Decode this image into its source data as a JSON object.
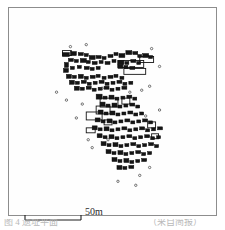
{
  "figure": {
    "kind": "archaeological-site-plan",
    "frame_color": "#8d8d8d",
    "background_color": "#ffffff",
    "ink_color": "#111111"
  },
  "scale": {
    "label": "50m",
    "bar_length_px": 56,
    "units": "m",
    "value": 50
  },
  "caption": {
    "left_fragment": "图 4  遗址平面",
    "right_fragment": "（采自简报）"
  },
  "map_data": {
    "type": "site-plan",
    "description": "Scatter of rectangular structure footprints forming a settlement band running from upper-left to lower-right across the plate.",
    "structures_filled": [
      [
        62,
        52,
        7,
        4
      ],
      [
        70,
        51,
        6,
        4
      ],
      [
        78,
        52,
        5,
        3
      ],
      [
        84,
        53,
        4,
        3
      ],
      [
        89,
        55,
        6,
        4
      ],
      [
        96,
        55,
        5,
        3
      ],
      [
        102,
        56,
        4,
        3
      ],
      [
        108,
        54,
        5,
        3
      ],
      [
        114,
        52,
        4,
        3
      ],
      [
        119,
        53,
        6,
        4
      ],
      [
        126,
        50,
        6,
        4
      ],
      [
        133,
        51,
        5,
        3
      ],
      [
        138,
        54,
        4,
        3
      ],
      [
        143,
        53,
        6,
        4
      ],
      [
        149,
        55,
        4,
        3
      ],
      [
        68,
        58,
        5,
        3
      ],
      [
        74,
        59,
        4,
        3
      ],
      [
        80,
        58,
        6,
        4
      ],
      [
        86,
        60,
        4,
        3
      ],
      [
        92,
        61,
        5,
        3
      ],
      [
        99,
        60,
        4,
        3
      ],
      [
        105,
        61,
        5,
        3
      ],
      [
        112,
        59,
        4,
        3
      ],
      [
        118,
        60,
        6,
        4
      ],
      [
        125,
        61,
        4,
        3
      ],
      [
        131,
        59,
        5,
        3
      ],
      [
        137,
        61,
        4,
        3
      ],
      [
        64,
        62,
        4,
        5
      ],
      [
        63,
        68,
        5,
        4
      ],
      [
        70,
        66,
        4,
        3
      ],
      [
        77,
        65,
        4,
        3
      ],
      [
        84,
        66,
        5,
        3
      ],
      [
        90,
        67,
        4,
        3
      ],
      [
        96,
        66,
        4,
        3
      ],
      [
        118,
        64,
        5,
        4
      ],
      [
        124,
        65,
        4,
        3
      ],
      [
        130,
        66,
        5,
        3
      ],
      [
        66,
        74,
        5,
        4
      ],
      [
        72,
        75,
        4,
        3
      ],
      [
        78,
        74,
        5,
        4
      ],
      [
        84,
        76,
        4,
        3
      ],
      [
        90,
        75,
        5,
        3
      ],
      [
        96,
        74,
        4,
        3
      ],
      [
        102,
        76,
        4,
        3
      ],
      [
        108,
        75,
        5,
        3
      ],
      [
        114,
        74,
        4,
        3
      ],
      [
        120,
        76,
        4,
        3
      ],
      [
        69,
        80,
        5,
        4
      ],
      [
        75,
        81,
        4,
        3
      ],
      [
        81,
        80,
        5,
        3
      ],
      [
        87,
        82,
        4,
        3
      ],
      [
        93,
        81,
        4,
        3
      ],
      [
        99,
        80,
        5,
        3
      ],
      [
        105,
        82,
        4,
        3
      ],
      [
        111,
        81,
        4,
        3
      ],
      [
        117,
        80,
        5,
        3
      ],
      [
        123,
        82,
        4,
        3
      ],
      [
        129,
        81,
        4,
        3
      ],
      [
        74,
        86,
        5,
        4
      ],
      [
        80,
        87,
        4,
        3
      ],
      [
        86,
        86,
        5,
        3
      ],
      [
        92,
        88,
        4,
        3
      ],
      [
        98,
        87,
        4,
        3
      ],
      [
        104,
        86,
        5,
        3
      ],
      [
        110,
        88,
        4,
        3
      ],
      [
        116,
        87,
        4,
        3
      ],
      [
        122,
        86,
        5,
        3
      ],
      [
        96,
        94,
        6,
        5
      ],
      [
        103,
        96,
        4,
        3
      ],
      [
        109,
        95,
        5,
        4
      ],
      [
        115,
        97,
        4,
        3
      ],
      [
        121,
        96,
        4,
        3
      ],
      [
        127,
        95,
        5,
        3
      ],
      [
        133,
        97,
        4,
        3
      ],
      [
        100,
        102,
        5,
        4
      ],
      [
        106,
        104,
        4,
        3
      ],
      [
        112,
        103,
        5,
        4
      ],
      [
        118,
        105,
        4,
        3
      ],
      [
        124,
        104,
        4,
        3
      ],
      [
        130,
        103,
        5,
        3
      ],
      [
        136,
        105,
        4,
        3
      ],
      [
        98,
        110,
        5,
        4
      ],
      [
        104,
        112,
        4,
        3
      ],
      [
        110,
        111,
        5,
        4
      ],
      [
        116,
        113,
        4,
        3
      ],
      [
        122,
        112,
        4,
        3
      ],
      [
        128,
        111,
        5,
        3
      ],
      [
        134,
        113,
        4,
        3
      ],
      [
        140,
        112,
        4,
        3
      ],
      [
        95,
        118,
        5,
        4
      ],
      [
        101,
        120,
        4,
        3
      ],
      [
        107,
        119,
        5,
        4
      ],
      [
        113,
        121,
        4,
        3
      ],
      [
        119,
        120,
        4,
        3
      ],
      [
        125,
        119,
        5,
        3
      ],
      [
        131,
        121,
        4,
        3
      ],
      [
        137,
        120,
        4,
        3
      ],
      [
        143,
        119,
        5,
        3
      ],
      [
        149,
        121,
        4,
        3
      ],
      [
        92,
        126,
        5,
        4
      ],
      [
        98,
        128,
        4,
        3
      ],
      [
        104,
        127,
        5,
        4
      ],
      [
        110,
        129,
        4,
        3
      ],
      [
        116,
        128,
        4,
        3
      ],
      [
        122,
        127,
        5,
        3
      ],
      [
        128,
        129,
        4,
        3
      ],
      [
        134,
        128,
        4,
        3
      ],
      [
        140,
        127,
        5,
        3
      ],
      [
        146,
        129,
        4,
        3
      ],
      [
        152,
        128,
        4,
        3
      ],
      [
        158,
        127,
        5,
        3
      ],
      [
        97,
        134,
        5,
        4
      ],
      [
        103,
        136,
        4,
        3
      ],
      [
        109,
        135,
        5,
        4
      ],
      [
        115,
        137,
        4,
        3
      ],
      [
        121,
        136,
        4,
        3
      ],
      [
        127,
        135,
        5,
        3
      ],
      [
        133,
        137,
        4,
        3
      ],
      [
        139,
        136,
        4,
        3
      ],
      [
        145,
        135,
        5,
        3
      ],
      [
        151,
        137,
        4,
        3
      ],
      [
        157,
        136,
        4,
        3
      ],
      [
        101,
        142,
        5,
        4
      ],
      [
        107,
        144,
        4,
        3
      ],
      [
        113,
        143,
        5,
        4
      ],
      [
        119,
        145,
        4,
        3
      ],
      [
        125,
        144,
        4,
        3
      ],
      [
        131,
        143,
        5,
        3
      ],
      [
        137,
        145,
        4,
        3
      ],
      [
        143,
        144,
        4,
        3
      ],
      [
        149,
        143,
        5,
        3
      ],
      [
        155,
        145,
        4,
        3
      ],
      [
        106,
        150,
        5,
        4
      ],
      [
        112,
        152,
        4,
        3
      ],
      [
        118,
        151,
        5,
        4
      ],
      [
        124,
        153,
        4,
        3
      ],
      [
        130,
        152,
        4,
        3
      ],
      [
        136,
        151,
        5,
        3
      ],
      [
        142,
        153,
        4,
        3
      ],
      [
        148,
        152,
        4,
        3
      ],
      [
        112,
        158,
        5,
        4
      ],
      [
        118,
        160,
        4,
        3
      ],
      [
        124,
        159,
        5,
        4
      ],
      [
        130,
        161,
        4,
        3
      ],
      [
        136,
        160,
        4,
        3
      ],
      [
        142,
        159,
        5,
        3
      ],
      [
        117,
        166,
        5,
        4
      ],
      [
        123,
        167,
        4,
        3
      ],
      [
        129,
        166,
        5,
        3
      ]
    ],
    "structures_outlined": [
      [
        100,
        98,
        18,
        9
      ],
      [
        96,
        106,
        14,
        8
      ],
      [
        86,
        112,
        16,
        8
      ],
      [
        118,
        60,
        26,
        7
      ],
      [
        124,
        68,
        22,
        6
      ],
      [
        140,
        56,
        14,
        6
      ],
      [
        62,
        50,
        9,
        5
      ],
      [
        148,
        122,
        8,
        6
      ],
      [
        152,
        134,
        7,
        5
      ],
      [
        86,
        128,
        9,
        5
      ],
      [
        104,
        120,
        8,
        5
      ],
      [
        122,
        98,
        8,
        6
      ]
    ],
    "dots_small": [
      [
        56,
        92
      ],
      [
        70,
        46
      ],
      [
        86,
        44
      ],
      [
        152,
        48
      ],
      [
        160,
        66
      ],
      [
        150,
        86
      ],
      [
        82,
        104
      ],
      [
        88,
        140
      ],
      [
        92,
        148
      ],
      [
        108,
        140
      ],
      [
        146,
        116
      ],
      [
        160,
        110
      ],
      [
        140,
        176
      ],
      [
        150,
        168
      ],
      [
        118,
        182
      ],
      [
        136,
        186
      ],
      [
        76,
        118
      ],
      [
        130,
        92
      ],
      [
        142,
        90
      ],
      [
        102,
        88
      ],
      [
        66,
        100
      ]
    ]
  }
}
